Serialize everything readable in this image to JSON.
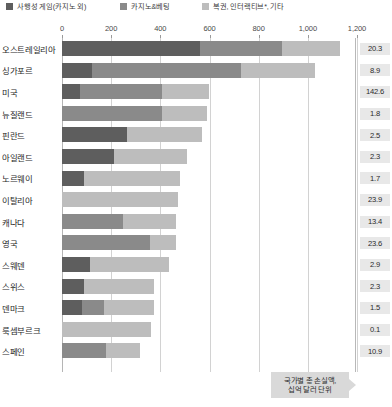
{
  "legend": {
    "items": [
      {
        "label": "사행성 게임(카지노 외)",
        "color": "#5e5e5e",
        "left": 6
      },
      {
        "label": "카지노&베팅",
        "color": "#8a8a8a",
        "left": 120
      },
      {
        "label": "복권, 인터랙티브*, 기타",
        "color": "#bdbdbd",
        "left": 202
      }
    ]
  },
  "callout": {
    "line1": "국가별 총 손실액,",
    "line2": "십억 달러 단위"
  },
  "chart_data": {
    "type": "bar",
    "orientation": "horizontal",
    "stacked": true,
    "title": "",
    "xlabel": "",
    "ylabel": "",
    "xlim": [
      0,
      1200
    ],
    "grid": true,
    "legend_position": "top",
    "xticks": [
      "0",
      "200",
      "400",
      "600",
      "800",
      "1,000",
      "1,200"
    ],
    "xtick_values": [
      0,
      200,
      400,
      600,
      800,
      1000,
      1200
    ],
    "series": [
      {
        "name": "사행성 게임(카지노 외)",
        "color": "#5e5e5e"
      },
      {
        "name": "카지노&베팅",
        "color": "#8a8a8a"
      },
      {
        "name": "복권, 인터랙티브*, 기타",
        "color": "#bdbdbd"
      }
    ],
    "value_column_label": "국가별 총 손실액, 십억 달러 단위",
    "categories": [
      "오스트레일리아",
      "싱가포르",
      "미국",
      "뉴질랜드",
      "핀란드",
      "아일랜드",
      "노르웨이",
      "이탈리아",
      "캐나다",
      "영국",
      "스웨덴",
      "스위스",
      "덴마크",
      "룩셈부르크",
      "스페인"
    ],
    "rows": [
      {
        "category": "오스트레일리아",
        "segments": [
          560,
          335,
          237
        ],
        "total_per_capita": 1132,
        "value": "20.3"
      },
      {
        "category": "싱가포르",
        "segments": [
          122,
          606,
          302
        ],
        "total_per_capita": 1030,
        "value": "8.9"
      },
      {
        "category": "미국",
        "segments": [
          75,
          332,
          193
        ],
        "total_per_capita": 600,
        "value": "142.6"
      },
      {
        "category": "뉴질랜드",
        "segments": [
          0,
          407,
          183
        ],
        "total_per_capita": 590,
        "value": "1.8"
      },
      {
        "category": "핀란드",
        "segments": [
          265,
          0,
          305
        ],
        "total_per_capita": 570,
        "value": "2.5"
      },
      {
        "category": "아일랜드",
        "segments": [
          212,
          0,
          298
        ],
        "total_per_capita": 510,
        "value": "2.3"
      },
      {
        "category": "노르웨이",
        "segments": [
          90,
          0,
          390
        ],
        "total_per_capita": 480,
        "value": "1.7"
      },
      {
        "category": "이탈리아",
        "segments": [
          0,
          0,
          470
        ],
        "total_per_capita": 470,
        "value": "23.9"
      },
      {
        "category": "캐나다",
        "segments": [
          0,
          250,
          215
        ],
        "total_per_capita": 465,
        "value": "13.4"
      },
      {
        "category": "영국",
        "segments": [
          0,
          357,
          108
        ],
        "total_per_capita": 465,
        "value": "23.6"
      },
      {
        "category": "스웨덴",
        "segments": [
          115,
          0,
          320
        ],
        "total_per_capita": 435,
        "value": "2.9"
      },
      {
        "category": "스위스",
        "segments": [
          90,
          0,
          285
        ],
        "total_per_capita": 375,
        "value": "2.3"
      },
      {
        "category": "덴마크",
        "segments": [
          80,
          90,
          205
        ],
        "total_per_capita": 375,
        "value": "1.5"
      },
      {
        "category": "룩셈부르크",
        "segments": [
          0,
          0,
          360
        ],
        "total_per_capita": 360,
        "value": "0.1"
      },
      {
        "category": "스페인",
        "segments": [
          0,
          178,
          140
        ],
        "total_per_capita": 318,
        "value": "10.9"
      }
    ]
  }
}
